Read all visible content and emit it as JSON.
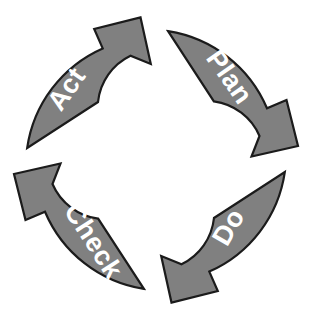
{
  "diagram": {
    "name": "PDCA cycle",
    "type": "cyclical-process-diagram",
    "direction": "clockwise",
    "background_color": "#ffffff",
    "arrow_fill_color": "#808080",
    "arrow_outline_color": "#1b1b1b",
    "label_color": "#ffffff",
    "center": {
      "x": 156,
      "y": 160
    },
    "inner_radius": 58,
    "outer_radius": 130,
    "steps": [
      {
        "id": "plan",
        "label": "Plan",
        "quadrant": "top-right",
        "start_angle_deg": -78,
        "end_angle_deg": 18,
        "label_x": 228,
        "label_y": 78,
        "label_rotation_deg": 55
      },
      {
        "id": "do",
        "label": "Do",
        "quadrant": "bottom-right",
        "start_angle_deg": 12,
        "end_angle_deg": 108,
        "label_x": 230,
        "label_y": 228,
        "label_rotation_deg": -60
      },
      {
        "id": "check",
        "label": "Check",
        "quadrant": "bottom-left",
        "start_angle_deg": 102,
        "end_angle_deg": 198,
        "label_x": 92,
        "label_y": 242,
        "label_rotation_deg": 57
      },
      {
        "id": "act",
        "label": "Act",
        "quadrant": "top-left",
        "start_angle_deg": 192,
        "end_angle_deg": 288,
        "label_x": 68,
        "label_y": 90,
        "label_rotation_deg": -55
      }
    ]
  }
}
